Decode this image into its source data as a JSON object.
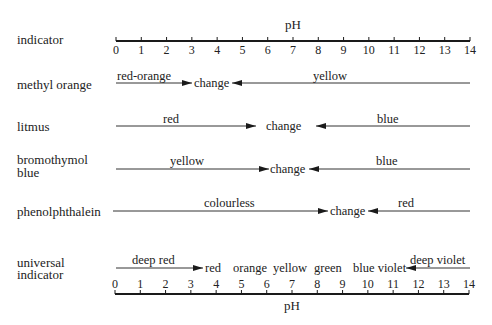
{
  "chart_data": {
    "type": "diagram",
    "axis": {
      "label": "pH",
      "min": 0,
      "max": 14,
      "ticks": [
        "0",
        "1",
        "2",
        "3",
        "4",
        "5",
        "6",
        "7",
        "8",
        "9",
        "10",
        "11",
        "12",
        "13",
        "14"
      ]
    },
    "header_label": "indicator",
    "indicators": [
      {
        "name": "methyl orange",
        "acid_colour": "red-orange",
        "alkali_colour": "yellow",
        "change_label": "change",
        "change_range": [
          3.0,
          4.6
        ]
      },
      {
        "name": "litmus",
        "acid_colour": "red",
        "alkali_colour": "blue",
        "change_label": "change",
        "change_range": [
          5.5,
          7.9
        ]
      },
      {
        "name_line1": "bromothymol",
        "name_line2": "blue",
        "name": "bromothymol blue",
        "acid_colour": "yellow",
        "alkali_colour": "blue",
        "change_label": "change",
        "change_range": [
          6.0,
          7.6
        ]
      },
      {
        "name": "phenolphthalein",
        "acid_colour": "colourless",
        "alkali_colour": "red",
        "change_label": "change",
        "change_range": [
          8.3,
          10.0
        ]
      }
    ],
    "universal_indicator": {
      "name_line1": "universal",
      "name_line2": "indicator",
      "low_label": "deep red",
      "low_range": [
        0,
        3
      ],
      "middle_colours": [
        "red",
        "orange",
        "yellow",
        "green",
        "blue violet"
      ],
      "middle_text": "red   orange yellow  green   blue violet",
      "high_label": "deep violet",
      "high_range": [
        12,
        14
      ]
    }
  },
  "labels": {
    "ph_top": "pH",
    "ph_bottom": "pH",
    "indicator": "indicator",
    "mo_name": "methyl orange",
    "mo_acid": "red-orange",
    "mo_change": "change",
    "mo_alk": "yellow",
    "lit_name": "litmus",
    "lit_acid": "red",
    "lit_change": "change",
    "lit_alk": "blue",
    "btb_name1": "bromothymol",
    "btb_name2": "blue",
    "btb_acid": "yellow",
    "btb_change": "change",
    "btb_alk": "blue",
    "php_name": "phenolphthalein",
    "php_acid": "colourless",
    "php_change": "change",
    "php_alk": "red",
    "ui_name1": "universal",
    "ui_name2": "indicator",
    "ui_low": "deep red",
    "ui_red": "red",
    "ui_orange": "orange",
    "ui_yellow": "yellow",
    "ui_green": "green",
    "ui_blueviolet": "blue violet",
    "ui_high": "deep violet"
  },
  "ticks": [
    "0",
    "1",
    "2",
    "3",
    "4",
    "5",
    "6",
    "7",
    "8",
    "9",
    "10",
    "11",
    "12",
    "13",
    "14"
  ],
  "colors": {
    "ink": "#1a1a1a",
    "line": "#333333",
    "background": "#ffffff"
  }
}
